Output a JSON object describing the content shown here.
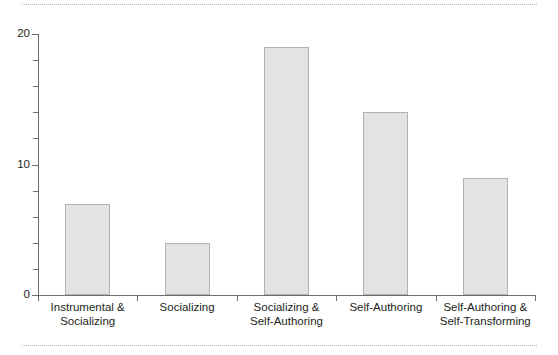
{
  "figure": {
    "background_color": "#ffffff",
    "rules": {
      "top_label": "top-dotted-rule",
      "bottom_label": "bottom-dotted-rule",
      "color": "#b9b6b6"
    }
  },
  "chart_data": {
    "type": "bar",
    "title": "",
    "xlabel": "",
    "ylabel": "",
    "categories": [
      "Instrumental & Socializing",
      "Socializing",
      "Socializing & Self-Authoring",
      "Self-Authoring",
      "Self-Authoring & Self-Transforming"
    ],
    "category_lines": [
      [
        "Instrumental &",
        "Socializing"
      ],
      [
        "Socializing"
      ],
      [
        "Socializing &",
        "Self-Authoring"
      ],
      [
        "Self-Authoring"
      ],
      [
        "Self-Authoring &",
        "Self-Transforming"
      ]
    ],
    "values": [
      7,
      4,
      19,
      14,
      9
    ],
    "ylim": [
      0,
      20
    ],
    "ytick_labels": [
      "0",
      "10",
      "20"
    ],
    "ytick_values": [
      0,
      10,
      20
    ],
    "yminor_values": [
      2,
      4,
      6,
      8,
      12,
      14,
      16,
      18
    ],
    "grid": false,
    "legend": null,
    "bar_fill_color": "#e3e3e3",
    "bar_border_color": "#b2b2b2",
    "axis_color": "#6e6e6e"
  }
}
